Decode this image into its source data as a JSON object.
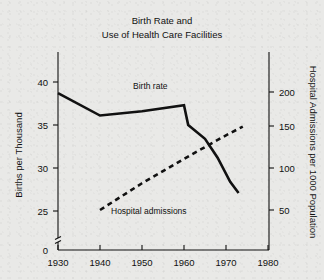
{
  "chart_data": {
    "type": "line",
    "title": "Birth Rate and Use of Health Care Facilities",
    "title_line1": "Birth Rate and",
    "title_line2": "Use of Health Care Facilities",
    "xlabel": "",
    "xlim": [
      1930,
      1980
    ],
    "x_ticks": [
      1930,
      1940,
      1950,
      1960,
      1970,
      1980
    ],
    "x_tick_labels": [
      "1930",
      "1940",
      "1950",
      "1960",
      "1970",
      "1980"
    ],
    "grid": false,
    "legend_position": "inline-annotations",
    "axes": {
      "left": {
        "ylabel": "Births per Thousand",
        "ylim": [
          23,
          41.5
        ],
        "ticks": [
          25,
          30,
          35,
          40
        ],
        "tick_labels": [
          "25",
          "30",
          "35",
          "40"
        ],
        "origin_label": "0",
        "axis_break": true
      },
      "right": {
        "ylabel": "Hospital Admissions per 1000 Population",
        "ylim": [
          10,
          230
        ],
        "ticks": [
          50,
          100,
          150,
          200
        ],
        "tick_labels": [
          "50",
          "100",
          "150",
          "200"
        ]
      }
    },
    "series": [
      {
        "name": "Birth rate",
        "label": "Birth rate",
        "style": "solid",
        "axis": "left",
        "units": "births per thousand",
        "x": [
          1930,
          1940,
          1950,
          1960,
          1961,
          1965,
          1968,
          1971,
          1973
        ],
        "values": [
          38.7,
          36.1,
          36.6,
          37.3,
          35.0,
          33.4,
          31.2,
          28.4,
          27.1
        ]
      },
      {
        "name": "Hospital admissions",
        "label": "Hospital admissions",
        "style": "dashed",
        "axis": "right",
        "units": "admissions per 1000 population",
        "x": [
          1940,
          1950,
          1960,
          1970,
          1974
        ],
        "values": [
          50,
          84,
          115,
          145,
          156
        ]
      }
    ],
    "annotations": [
      {
        "text": "Birth rate",
        "x": 1953,
        "y_left": 38.6
      },
      {
        "text": "Hospital admissions",
        "x": 1949,
        "y_left": 24.6
      }
    ],
    "colors": {
      "background": "#e9e9e7",
      "ink": "#111111"
    }
  }
}
